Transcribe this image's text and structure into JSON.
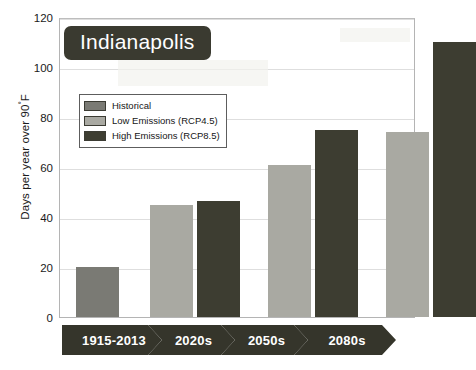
{
  "chart_data": {
    "type": "bar",
    "title": "Indianapolis",
    "xlabel": "",
    "ylabel": "Days per year over 90°F",
    "ylabel_text": "Days per year over 90",
    "ylabel_degree": "°",
    "ylabel_unit": "F",
    "categories": [
      "1915-2013",
      "2020s",
      "2050s",
      "2080s"
    ],
    "ylim": [
      0,
      120
    ],
    "yticks": [
      0,
      20,
      40,
      60,
      80,
      100,
      120
    ],
    "ytick_labels": [
      "0",
      "20",
      "40",
      "60",
      "80",
      "100",
      "120"
    ],
    "grid": true,
    "legend_position": "upper-left-inside",
    "series": [
      {
        "name": "Historical",
        "color": "#7a7a74",
        "values": [
          20,
          null,
          null,
          null
        ]
      },
      {
        "name": "Low Emissions (RCP4.5)",
        "color": "#a9a9a2",
        "values": [
          null,
          45,
          61,
          74
        ]
      },
      {
        "name": "High Emissions (RCP8.5)",
        "color": "#3d3d31",
        "values": [
          null,
          46.5,
          75,
          110
        ]
      }
    ],
    "bars": [
      {
        "label": "1915-2013",
        "series": "Historical",
        "value": 20,
        "color": "#7a7a74"
      },
      {
        "label": "2020s",
        "series": "Low Emissions (RCP4.5)",
        "value": 45,
        "color": "#a9a9a2"
      },
      {
        "label": "2020s",
        "series": "High Emissions (RCP8.5)",
        "value": 46.5,
        "color": "#3d3d31"
      },
      {
        "label": "2050s",
        "series": "Low Emissions (RCP4.5)",
        "value": 61,
        "color": "#a9a9a2"
      },
      {
        "label": "2050s",
        "series": "High Emissions (RCP8.5)",
        "value": 75,
        "color": "#3d3d31"
      },
      {
        "label": "2080s",
        "series": "Low Emissions (RCP4.5)",
        "value": 74,
        "color": "#a9a9a2"
      },
      {
        "label": "2080s",
        "series": "High Emissions (RCP8.5)",
        "value": 110,
        "color": "#3d3d31"
      }
    ]
  },
  "legend": {
    "entries": [
      {
        "label": "Historical",
        "color": "#7a7a74"
      },
      {
        "label": "Low Emissions (RCP4.5)",
        "color": "#a9a9a2"
      },
      {
        "label": "High Emissions (RCP8.5)",
        "color": "#3d3d31"
      }
    ]
  },
  "axis": {
    "y_ticks": [
      "120",
      "100",
      "80",
      "60",
      "40",
      "20",
      "0"
    ],
    "x_categories": [
      "1915-2013",
      "2020s",
      "2050s",
      "2080s"
    ]
  },
  "colors": {
    "historical": "#7a7a74",
    "low_emissions": "#a9a9a2",
    "high_emissions": "#3d3d31",
    "title_pill": "#3a3a30",
    "frame": "#b4b4b4",
    "grid": "#dedede"
  }
}
